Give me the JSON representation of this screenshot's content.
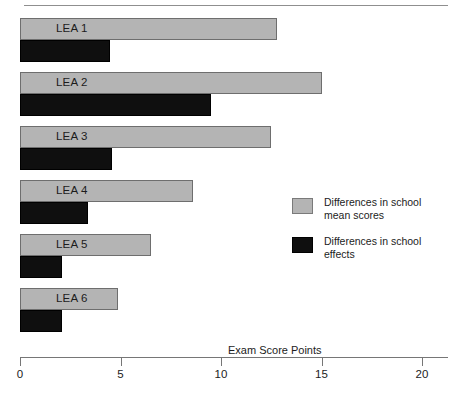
{
  "chart_data": {
    "type": "bar",
    "orientation": "horizontal",
    "title": "",
    "xlabel": "Exam Score Points",
    "ylabel": "",
    "xlim": [
      0,
      20
    ],
    "xticks": [
      0,
      5,
      10,
      15,
      20
    ],
    "xtick_labels": [
      "0",
      "5",
      "10",
      "15",
      "20"
    ],
    "grid": false,
    "legend_position": "right",
    "categories": [
      "LEA 1",
      "LEA 2",
      "LEA 3",
      "LEA 4",
      "LEA 5",
      "LEA 6"
    ],
    "series": [
      {
        "name": "Differences in school mean scores",
        "color": "#b4b4b4",
        "values": [
          12.8,
          15.0,
          12.5,
          8.6,
          6.5,
          4.9
        ]
      },
      {
        "name": "Differences in school effects",
        "color": "#0f0f0f",
        "values": [
          4.5,
          9.5,
          4.6,
          3.4,
          2.1,
          2.1
        ]
      }
    ]
  },
  "axis": {
    "title": "Exam Score Points",
    "ticks": [
      "0",
      "5",
      "10",
      "15",
      "20"
    ]
  },
  "legend": {
    "items": [
      {
        "label": "Differences in school\nmean scores",
        "swatch": "mean"
      },
      {
        "label": "Differences in school\neffects",
        "swatch": "effect"
      }
    ]
  },
  "bars": [
    {
      "label": "LEA 1",
      "mean": 12.8,
      "effect": 4.5
    },
    {
      "label": "LEA 2",
      "mean": 15.0,
      "effect": 9.5
    },
    {
      "label": "LEA 3",
      "mean": 12.5,
      "effect": 4.6
    },
    {
      "label": "LEA 4",
      "mean": 8.6,
      "effect": 3.4
    },
    {
      "label": "LEA 5",
      "mean": 6.5,
      "effect": 2.1
    },
    {
      "label": "LEA 6",
      "mean": 4.9,
      "effect": 2.1
    }
  ]
}
